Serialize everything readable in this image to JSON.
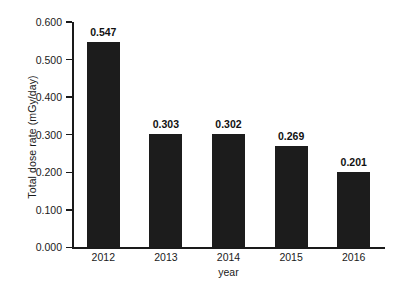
{
  "chart_data": {
    "type": "bar",
    "title": "",
    "xlabel": "year",
    "ylabel": "Total dose rate (mGy/day)",
    "categories": [
      "2012",
      "2013",
      "2014",
      "2015",
      "2016"
    ],
    "values": [
      0.547,
      0.303,
      0.302,
      0.269,
      0.201
    ],
    "value_labels": [
      "0.547",
      "0.303",
      "0.302",
      "0.269",
      "0.201"
    ],
    "ylim": [
      0.0,
      0.6
    ],
    "ytick_values": [
      0.0,
      0.1,
      0.2,
      0.3,
      0.4,
      0.5,
      0.6
    ],
    "ytick_labels": [
      "0.000",
      "0.100",
      "0.200",
      "0.300",
      "0.400",
      "0.500",
      "0.600"
    ],
    "grid": false,
    "legend": false,
    "legend_position": "none",
    "bar_color": "#1c1c1c",
    "axis_color": "#1a1a1a",
    "background_color": "#ffffff"
  }
}
